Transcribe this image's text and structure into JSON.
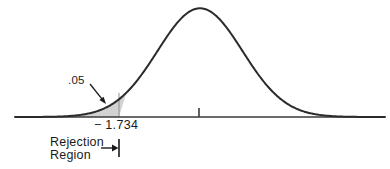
{
  "figure": {
    "type": "statistical-distribution-diagram",
    "background_color": "#ffffff",
    "curve_color": "#2b2b2b",
    "axis_color": "#3a3a3a",
    "shade_color": "#d2d2d2",
    "shade_border_color": "#8f8f8f",
    "annotation_color": "#1a1a1a"
  },
  "labels": {
    "alpha": ".05",
    "critical_value": "− 1.734",
    "rejection_region_line1": "Rejection",
    "rejection_region_line2": "Region"
  },
  "chart_data": {
    "type": "area",
    "title": "",
    "subtitle": "",
    "xlabel": "",
    "ylabel": "",
    "distribution": "normal",
    "mean": 0,
    "sd": 1,
    "xlim": [
      -4.35,
      4.35
    ],
    "ylim": [
      0,
      0.4
    ],
    "grid": false,
    "legend": null,
    "x": [
      -4.35,
      -4.0,
      -3.6,
      -3.2,
      -2.8,
      -2.4,
      -2.0,
      -1.734,
      -1.6,
      -1.2,
      -0.8,
      -0.4,
      0.0,
      0.4,
      0.8,
      1.2,
      1.6,
      2.0,
      2.4,
      2.8,
      3.2,
      3.6,
      4.0,
      4.35
    ],
    "y": [
      0.00029,
      0.00134,
      0.00061,
      0.00238,
      0.00792,
      0.02239,
      0.05399,
      0.08874,
      0.11092,
      0.19419,
      0.28969,
      0.36827,
      0.39894,
      0.36827,
      0.28969,
      0.19419,
      0.11092,
      0.05399,
      0.02239,
      0.00792,
      0.00238,
      0.00061,
      0.00134,
      0.00029
    ],
    "shaded_region": {
      "name": "rejection region",
      "tail": "left",
      "from": -4.35,
      "to": -1.734,
      "area": 0.05,
      "area_label": ".05",
      "boundary_value": -1.734,
      "boundary_label": "− 1.734"
    },
    "ticks": [
      {
        "value": 0,
        "label": ""
      },
      {
        "value": -1.734,
        "label": "− 1.734"
      }
    ],
    "annotations": [
      {
        "text": ".05",
        "points_to": "shaded tail area",
        "arrow": true
      },
      {
        "text": "Rejection Region",
        "points_to": "critical value boundary",
        "arrow": true
      }
    ]
  },
  "geometry": {
    "baseline_y": 117,
    "axis_x_start": 15,
    "axis_x_end": 385,
    "peak_x": 199,
    "peak_y": 8,
    "critical_x": 119,
    "center_tick_x": 199,
    "center_tick_top": 108,
    "rr_bar_x": 119,
    "rr_bar_top": 139,
    "rr_bar_bottom": 157,
    "rr_arrow_from_x": 101,
    "rr_arrow_to_x": 118,
    "rr_arrow_y": 148,
    "alpha_arrow_from": [
      90,
      84
    ],
    "alpha_arrow_to": [
      106,
      104
    ]
  }
}
